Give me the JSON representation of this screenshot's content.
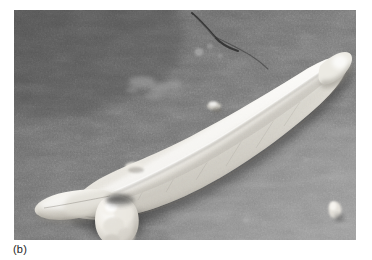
{
  "figure": {
    "caption_label": "(b)",
    "panel_letter": "b",
    "kind": "scanning-electron-micrograph",
    "background_color": "#6e6e6e",
    "specimen_color": "#e8e6e0",
    "caption_color": "#232323",
    "page_color": "#ffffff"
  },
  "micrograph": {
    "frame": {
      "x": 14,
      "y": 10,
      "width": 342,
      "height": 230
    },
    "features": [
      {
        "name": "main-cell-body",
        "description": "elongated lunate (crescent) cell running lower-left to upper-right"
      },
      {
        "name": "raphe-ridge",
        "description": "bright longitudinal ridge along the upper margin of the cell"
      },
      {
        "name": "left-apex",
        "description": "tapered rounded apex at lower-left"
      },
      {
        "name": "right-apex",
        "description": "tapered rounded apex at upper-right"
      },
      {
        "name": "attached-bud",
        "description": "bright lumpy rounded bud attached beneath the cell, left of centre"
      },
      {
        "name": "substrate-crack",
        "description": "dark hairline crack across the upper portion of the substrate"
      },
      {
        "name": "debris-patch",
        "description": "faint light debris smear upper-left of the cell"
      },
      {
        "name": "bright-particle",
        "description": "small bright particle near the lower-right corner"
      }
    ]
  }
}
